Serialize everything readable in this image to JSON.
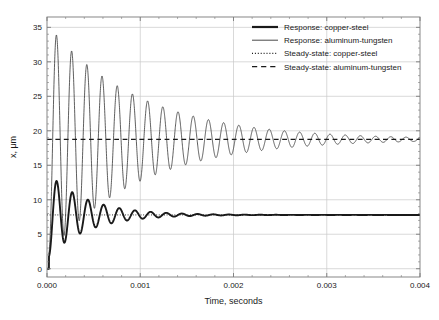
{
  "chart_data": {
    "type": "line",
    "title": "",
    "xlabel": "Time, seconds",
    "ylabel": "x, μm",
    "xlim": [
      0,
      0.004
    ],
    "ylim": [
      -1.2,
      36.5
    ],
    "xticks": [
      0,
      0.001,
      0.002,
      0.003,
      0.004
    ],
    "xticklabels": [
      "0.000",
      "0.001",
      "0.002",
      "0.003",
      "0.004"
    ],
    "yticks": [
      0,
      5,
      10,
      15,
      20,
      25,
      30,
      35
    ],
    "yticklabels": [
      "0",
      "5",
      "10",
      "15",
      "20",
      "25",
      "30",
      "35"
    ],
    "grid": true,
    "grid_color": "#c8c8c8",
    "frame_color": "#7a7a7a",
    "background": "#ffffff",
    "legend_position": "top-right",
    "series": [
      {
        "name": "Response: copper-steel",
        "style": "solid",
        "width": 1.9,
        "color": "#1a1a1a",
        "model": "damped_step",
        "steady_state": 7.8,
        "peak_first": 13.8,
        "trough_first": 3.3,
        "period": 0.000168,
        "decay_tau": 0.00042,
        "t_start": 2e-05
      },
      {
        "name": "Response: aluminum-tungsten",
        "style": "solid",
        "width": 0.75,
        "color": "#2a2a2a",
        "model": "damped_step",
        "steady_state": 18.75,
        "peak_first": 35.2,
        "trough_first": 3.1,
        "period": 0.000163,
        "decay_tau": 0.00098,
        "t_start": 2e-05
      },
      {
        "name": "Steady-state: copper-steel",
        "style": "dotted",
        "width": 1.0,
        "color": "#1a1a1a",
        "model": "constant",
        "value": 7.8,
        "x_end": 0.0013
      },
      {
        "name": "Steady-state: aluminum-tungsten",
        "style": "dashed",
        "width": 1.2,
        "color": "#1a1a1a",
        "model": "constant",
        "value": 18.75,
        "x_end": 0.0021
      }
    ]
  },
  "legend": {
    "items": [
      {
        "label": "Response: copper-steel",
        "style": "solid",
        "width": 2.2
      },
      {
        "label": "Response: aluminum-tungsten",
        "style": "solid",
        "width": 0.8
      },
      {
        "label": "Steady-state: copper-steel",
        "style": "dotted",
        "width": 1.1
      },
      {
        "label": "Steady-state: aluminum-tungsten",
        "style": "dashed",
        "width": 1.3
      }
    ]
  }
}
